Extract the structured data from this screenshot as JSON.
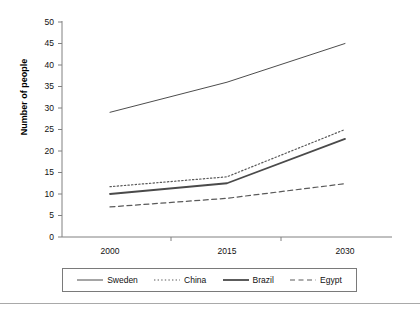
{
  "chart_data": {
    "type": "line",
    "title": "",
    "xlabel": "",
    "ylabel": "Number of people",
    "categories": [
      "2000",
      "2015",
      "2030"
    ],
    "x": [
      2000,
      2015,
      2030
    ],
    "ylim": [
      0,
      50
    ],
    "yticks": [
      0,
      5,
      10,
      15,
      20,
      25,
      30,
      35,
      40,
      45,
      50
    ],
    "ytick_labels": [
      "0",
      "5",
      "10",
      "15",
      "20",
      "25",
      "30",
      "35",
      "40",
      "45",
      "50"
    ],
    "grid": false,
    "legend_position": "bottom",
    "series": [
      {
        "name": "Sweden",
        "values": [
          29,
          36,
          45
        ],
        "style": "solid",
        "width": 1,
        "color": "#4d4d4d"
      },
      {
        "name": "China",
        "values": [
          11.7,
          14,
          25
        ],
        "style": "dotted",
        "width": 1.2,
        "color": "#5a5a5a"
      },
      {
        "name": "Brazil",
        "values": [
          10,
          12.5,
          22.8
        ],
        "style": "solid",
        "width": 1.8,
        "color": "#4a4a4a"
      },
      {
        "name": "Egypt",
        "values": [
          7,
          9,
          12.4
        ],
        "style": "dashed",
        "width": 1.2,
        "color": "#5a5a5a"
      }
    ]
  },
  "axis": {
    "y_title": "Number of people"
  },
  "legend": {
    "items": [
      {
        "label": "Sweden"
      },
      {
        "label": "China"
      },
      {
        "label": "Brazil"
      },
      {
        "label": "Egypt"
      }
    ]
  }
}
